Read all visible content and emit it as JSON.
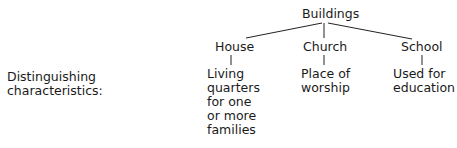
{
  "diagram": {
    "root": "Buildings",
    "row_label": "Distinguishing\ncharacteristics:",
    "children": [
      {
        "label": "House",
        "description": "Living\nquarters\nfor one\nor more\nfamilies"
      },
      {
        "label": "Church",
        "description": "Place of\nworship"
      },
      {
        "label": "School",
        "description": "Used for\neducation"
      }
    ]
  }
}
